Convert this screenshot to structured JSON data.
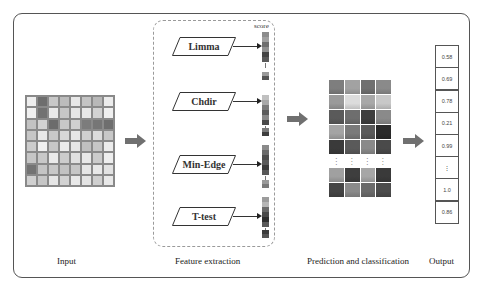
{
  "figure": {
    "stages": {
      "input": "Input",
      "feature_extraction": "Feature extraction",
      "prediction": "Prediction and classification",
      "output": "Output"
    },
    "input_matrix": {
      "rows": 8,
      "cols": 8,
      "cells": [
        [
          "#eeeeee",
          "#6e6e6e",
          "#c8c8c8",
          "#bcbcbc",
          "#e8e8e8",
          "#c4c4c4",
          "#b8b8b8",
          "#ececec"
        ],
        [
          "#f0f0f0",
          "#727272",
          "#eaeaea",
          "#c6c6c6",
          "#e6e6e6",
          "#e8e8e8",
          "#d2d2d2",
          "#f0f0f0"
        ],
        [
          "#c2c2c2",
          "#d2d2d2",
          "#6c6c6c",
          "#c8c8c8",
          "#d0d0d0",
          "#7c7c7c",
          "#767676",
          "#6e6e6e"
        ],
        [
          "#c6c6c6",
          "#e8e8e8",
          "#c8c8c8",
          "#d8d8d8",
          "#e6e6e6",
          "#d0d0d0",
          "#dcdcdc",
          "#c8c8c8"
        ],
        [
          "#cccccc",
          "#f0f0f0",
          "#c6c6c6",
          "#ececec",
          "#e6e6e6",
          "#c0c0c0",
          "#c6c6c6",
          "#ececec"
        ],
        [
          "#c6c6c6",
          "#c8c8c8",
          "#eaeaea",
          "#cccccc",
          "#e0e0e0",
          "#e8e8e8",
          "#cccccc",
          "#eeeeee"
        ],
        [
          "#737373",
          "#c4c4c4",
          "#c8c8c8",
          "#c2c2c2",
          "#c6c6c6",
          "#e6e6e6",
          "#e8e8e8",
          "#e2e2e2"
        ],
        [
          "#d0d0d0",
          "#c6c6c6",
          "#e6e6e6",
          "#d2d2d2",
          "#e8e8e8",
          "#e4e4e4",
          "#cfcfcf",
          "#e8e8e8"
        ]
      ]
    },
    "score_header": "score",
    "methods": [
      {
        "name": "Limma",
        "top": 37
      },
      {
        "name": "Chdir",
        "top": 92
      },
      {
        "name": "Min-Edge",
        "top": 155
      },
      {
        "name": "T-test",
        "top": 207
      }
    ],
    "score_bars": [
      {
        "top": 32,
        "colors": [
          "#8c8c8c",
          "#a0a0a0",
          "#6e6e6e",
          "#909090",
          "#444444",
          "#5a5a5a"
        ],
        "tail_top": 72,
        "tail": [
          "#9a9a9a",
          "#555555"
        ]
      },
      {
        "top": 95,
        "colors": [
          "#c0c0c0",
          "#a8a8a8",
          "#7a7a7a",
          "#5c5c5c",
          "#888888",
          "#4a4a4a"
        ],
        "tail_top": 128,
        "tail": [
          "#7a7a7a",
          "#3e3e3e"
        ]
      },
      {
        "top": 145,
        "colors": [
          "#8a8a8a",
          "#6a6a6a",
          "#4c4c4c",
          "#5a5a5a",
          "#3a3a3a",
          "#585858"
        ],
        "tail_top": 180,
        "tail": [
          "#9a9a9a",
          "#7a7a7a"
        ]
      },
      {
        "top": 197,
        "colors": [
          "#9c9c9c",
          "#b6b6b6",
          "#6a6a6a",
          "#4a4a4a",
          "#2e2e2e",
          "#5a5a5a"
        ],
        "tail_top": 230,
        "tail": [
          "#3c3c3c",
          "#555555"
        ]
      }
    ],
    "heatmap_upper": [
      [
        "#7e7e7e",
        "#a2a2a2",
        "#707070",
        "#8a8a8a"
      ],
      [
        "#9a9a9a",
        "#dcdcdc",
        "#a8a8a8",
        "#c8c8c8"
      ],
      [
        "#5a5a5a",
        "#6e6e6e",
        "#3e3e3e",
        "#8a8a8a"
      ],
      [
        "#a4a4a4",
        "#7a7a7a",
        "#5a5a5a",
        "#2a2a2a"
      ],
      [
        "#3a3a3a",
        "#5a5a5a",
        "#8a8a8a",
        "#4a4a4a"
      ]
    ],
    "heatmap_lower": [
      [
        "#a0a0a0",
        "#3e3e3e",
        "#a6a6a6",
        "#3a3a3a"
      ],
      [
        "#444444",
        "#8a8a8a",
        "#6a6a6a",
        "#4c4c4c"
      ]
    ],
    "output_values": [
      "0.58",
      "0.69",
      "0.78",
      "0.21",
      "0.99",
      "⋮",
      "1.0",
      "0.86"
    ],
    "colors": {
      "frame": "#555555",
      "arrow": "#707070",
      "dashed_panel": "#9a9a9a"
    }
  },
  "icons": {
    "stage_arrow": "right-block-arrow",
    "vertical_ellipsis": "⋮"
  }
}
